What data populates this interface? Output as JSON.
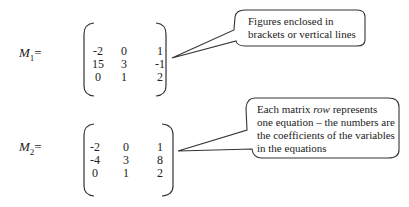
{
  "matrices": [
    {
      "label_main": "M",
      "label_sub": "1",
      "label_eq": "=",
      "rows": [
        [
          "-2",
          "0",
          "1"
        ],
        [
          "15",
          "3",
          "-1"
        ],
        [
          "0",
          "1",
          "2"
        ]
      ]
    },
    {
      "label_main": "M",
      "label_sub": "2",
      "label_eq": "=",
      "rows": [
        [
          "-2",
          "0",
          "1"
        ],
        [
          "-4",
          "3",
          "8"
        ],
        [
          "0",
          "1",
          "2"
        ]
      ]
    }
  ],
  "callouts": [
    {
      "lines": [
        "Figures enclosed in",
        "brackets or vertical lines"
      ]
    },
    {
      "lines_html": true,
      "line1_pre": "Each matrix ",
      "line1_em": "row",
      "line1_post": " represents",
      "line2": "one equation – the numbers are",
      "line3": "the coefficients of the variables",
      "line4": "in the equations"
    }
  ]
}
